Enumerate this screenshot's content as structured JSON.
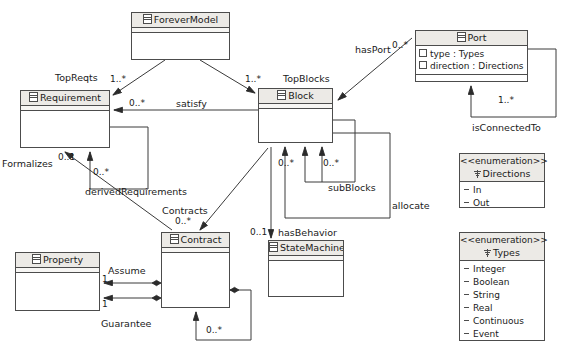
{
  "diagram": {
    "stroke_color": "#4c4c4c",
    "header_fill": "#eceae6",
    "background": "#ffffff"
  },
  "classes": [
    {
      "id": "forevermodel",
      "name": "ForeverModel",
      "icon": "class-icon",
      "attributes": []
    },
    {
      "id": "requirement",
      "name": "Requirement",
      "icon": "class-icon",
      "attributes": []
    },
    {
      "id": "block",
      "name": "Block",
      "icon": "class-icon",
      "attributes": []
    },
    {
      "id": "port",
      "name": "Port",
      "icon": "class-icon",
      "attributes": [
        {
          "name": "type",
          "type": "Types"
        },
        {
          "name": "direction",
          "type": "Directions"
        }
      ]
    },
    {
      "id": "property",
      "name": "Property",
      "icon": "class-icon",
      "attributes": []
    },
    {
      "id": "contract",
      "name": "Contract",
      "icon": "class-icon",
      "attributes": []
    },
    {
      "id": "statemachine",
      "name": "StateMachine",
      "icon": "class-icon",
      "attributes": []
    }
  ],
  "enumerations": [
    {
      "id": "directions",
      "stereotype": "<<enumeration>>",
      "name": "Directions",
      "icon": "enumeration-icon",
      "literals": [
        "In",
        "Out"
      ]
    },
    {
      "id": "types",
      "stereotype": "<<enumeration>>",
      "name": "Types",
      "icon": "enumeration-icon",
      "literals": [
        "Integer",
        "Boolean",
        "String",
        "Real",
        "Continuous",
        "Event"
      ]
    }
  ],
  "associations": [
    {
      "id": "topreqts",
      "label": "TopReqts",
      "from": "ForeverModel",
      "to": "Requirement",
      "multiplicity": "1..*"
    },
    {
      "id": "topblocks",
      "label": "TopBlocks",
      "from": "ForeverModel",
      "to": "Block",
      "multiplicity": "1..*"
    },
    {
      "id": "satisfy",
      "label": "satisfy",
      "from": "Block",
      "to": "Requirement",
      "multiplicity": "0..*"
    },
    {
      "id": "hasport",
      "label": "hasPort",
      "from": "Block",
      "to": "Port",
      "multiplicity": "0..*"
    },
    {
      "id": "isconnectedto",
      "label": "isConnectedTo",
      "from": "Port",
      "to": "Port",
      "multiplicity": "1..*"
    },
    {
      "id": "subblocks",
      "label": "subBlocks",
      "from": "Block",
      "to": "Block",
      "multiplicity": "0..*"
    },
    {
      "id": "allocate",
      "label": "allocate",
      "from": "Block",
      "to": "Block",
      "multiplicity": ""
    },
    {
      "id": "derivedrequirements",
      "label": "derivedRequirements",
      "from": "Requirement",
      "to": "Requirement",
      "multiplicity": "0..*"
    },
    {
      "id": "formalizes",
      "label": "Formalizes",
      "from": "Contract",
      "to": "Requirement",
      "multiplicity": "0..1"
    },
    {
      "id": "contracts",
      "label": "Contracts",
      "from": "Block",
      "to": "Contract",
      "multiplicity": "0..*"
    },
    {
      "id": "hasbehavior",
      "label": "hasBehavior",
      "from": "Block",
      "to": "StateMachine",
      "multiplicity": "0..1"
    },
    {
      "id": "assume",
      "label": "Assume",
      "from": "Contract",
      "to": "Property",
      "multiplicity": "1"
    },
    {
      "id": "guarantee",
      "label": "Guarantee",
      "from": "Contract",
      "to": "Property",
      "multiplicity": "1"
    },
    {
      "id": "contract-self",
      "label": "",
      "from": "Contract",
      "to": "Contract",
      "multiplicity": "0..*"
    },
    {
      "id": "block-left",
      "label": "",
      "from": "Block",
      "to": "Block",
      "multiplicity": "0..*"
    }
  ],
  "edge_labels": {
    "topreqts": "TopReqts",
    "topblocks": "TopBlocks",
    "satisfy": "satisfy",
    "hasport": "hasPort",
    "isconnectedto": "isConnectedTo",
    "subblocks": "subBlocks",
    "allocate": "allocate",
    "derivedrequirements": "derivedRequirements",
    "formalizes": "Formalizes",
    "contracts": "Contracts",
    "hasbehavior": "hasBehavior",
    "assume": "Assume",
    "guarantee": "Guarantee"
  },
  "multiplicities": {
    "topreqts": "1..*",
    "topblocks": "1..*",
    "satisfy": "0..*",
    "hasport": "0..*",
    "isconnectedto": "1..*",
    "subblocks_left": "0..*",
    "subblocks_right": "0..*",
    "derivedrequirements": "0..*",
    "formalizes": "0..1",
    "contracts": "0..*",
    "hasbehavior": "0..1",
    "assume": "1",
    "guarantee": "1",
    "contract_self": "0..*"
  }
}
